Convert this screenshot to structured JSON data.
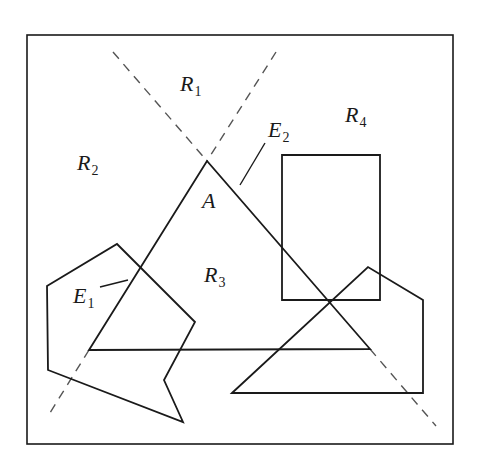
{
  "diagram": {
    "frame": {
      "x": 27,
      "y": 35,
      "w": 426,
      "h": 409
    },
    "stroke_color": "#1a1a1a",
    "dash_color": "#555555",
    "labels": [
      {
        "id": "R1",
        "main": "R",
        "sub": "1",
        "x": 180,
        "y": 91
      },
      {
        "id": "R2",
        "main": "R",
        "sub": "2",
        "x": 77,
        "y": 170
      },
      {
        "id": "R3",
        "main": "R",
        "sub": "3",
        "x": 204,
        "y": 282
      },
      {
        "id": "R4",
        "main": "R",
        "sub": "4",
        "x": 345,
        "y": 122
      },
      {
        "id": "A",
        "main": "A",
        "sub": "",
        "x": 202,
        "y": 208
      },
      {
        "id": "E1",
        "main": "E",
        "sub": "1",
        "x": 73,
        "y": 303
      },
      {
        "id": "E2",
        "main": "E",
        "sub": "2",
        "x": 268,
        "y": 137
      }
    ],
    "leaders": {
      "E1": "M100,287 L128,280",
      "E2": "M265,143 L240,185"
    },
    "shapes": {
      "triangle_A": "89,350 207,161 370,349",
      "rectangle": "282,155 380,155 380,300 282,300",
      "left_polygon": "47,286 117,244 195,322 164,380 183,422 48,370",
      "right_polygon": "232,393 368,267 423,300 423,393"
    },
    "dashed_lines": [
      "M113,52 L207,161",
      "M276,52 L207,161",
      "M370,349 L436,426",
      "M89,350 L48,416"
    ]
  }
}
